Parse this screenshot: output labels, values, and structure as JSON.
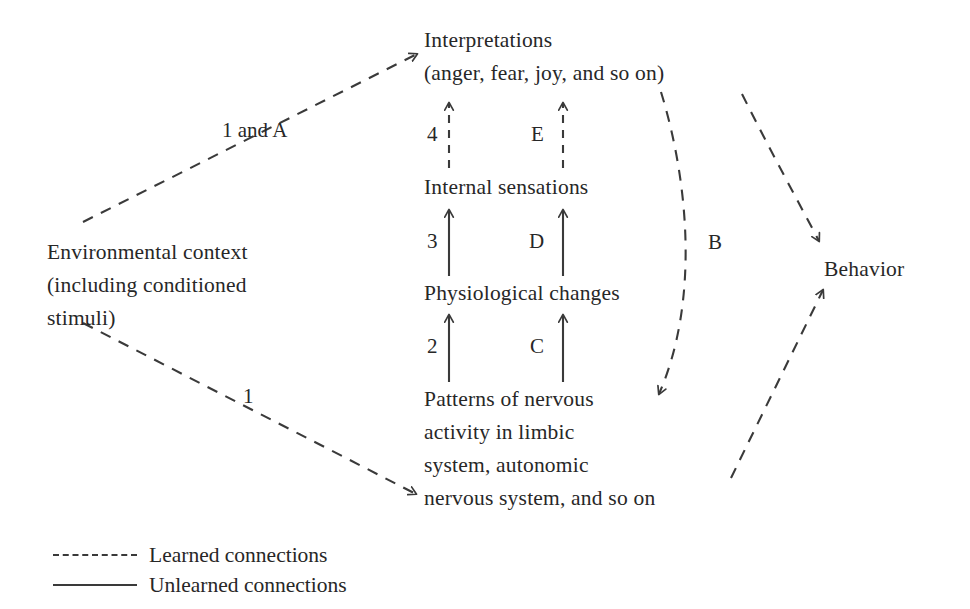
{
  "diagram": {
    "stroke_color": "#3a3a3a",
    "text_color": "#272727",
    "background": "#ffffff",
    "nodes": [
      {
        "id": "interpretations",
        "text": "Interpretations\n(anger, fear, joy, and so on)"
      },
      {
        "id": "internal-sensations",
        "text": "Internal sensations"
      },
      {
        "id": "physiological-changes",
        "text": "Physiological changes"
      },
      {
        "id": "patterns-of-nervous-activity",
        "text": "Patterns of nervous\nactivity in limbic\nsystem, autonomic\nnervous system, and so on"
      },
      {
        "id": "environmental-context",
        "text": "Environmental context\n(including conditioned\nstimuli)"
      },
      {
        "id": "behavior",
        "text": "Behavior"
      }
    ],
    "edge_labels": [
      {
        "id": "one-and-a",
        "text": "1 and A"
      },
      {
        "id": "four",
        "text": "4"
      },
      {
        "id": "e",
        "text": "E"
      },
      {
        "id": "three",
        "text": "3"
      },
      {
        "id": "d",
        "text": "D"
      },
      {
        "id": "two",
        "text": "2"
      },
      {
        "id": "c",
        "text": "C"
      },
      {
        "id": "b",
        "text": "B"
      },
      {
        "id": "one",
        "text": "1"
      }
    ],
    "legend": [
      {
        "id": "learned",
        "style": "dashed",
        "label": "Learned connections"
      },
      {
        "id": "unlearned",
        "style": "solid",
        "label": "Unlearned connections"
      }
    ]
  }
}
